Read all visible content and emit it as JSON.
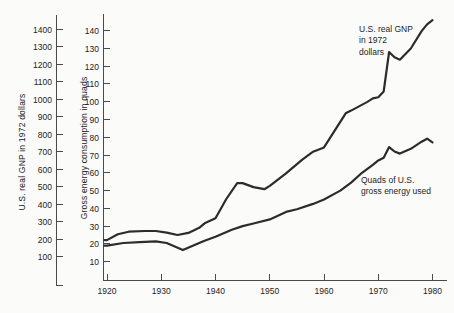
{
  "chart_data": {
    "type": "line",
    "title": "",
    "x_axis": {
      "label": "",
      "ticks": [
        1920,
        1930,
        1940,
        1950,
        1960,
        1970,
        1980
      ],
      "range": [
        1920,
        1980
      ]
    },
    "gnp_axis": {
      "label": "U.S. real GNP in 1972 dollars",
      "ticks": [
        100,
        200,
        300,
        400,
        500,
        600,
        700,
        800,
        900,
        1000,
        1100,
        1200,
        1300,
        1400
      ],
      "range": [
        0,
        1450
      ]
    },
    "energy_axis": {
      "label": "Gross energy consumption in quads",
      "ticks": [
        10,
        20,
        30,
        40,
        50,
        60,
        70,
        80,
        90,
        100,
        110,
        120,
        130,
        140
      ],
      "range": [
        0,
        145
      ]
    },
    "annotations": {
      "gnp": "U.S. real GNP\nin 1972\ndollars",
      "energy": "Quads of U.S.\ngross energy used"
    },
    "series": [
      {
        "name": "U.S. real GNP in 1972 dollars",
        "axis": "gnp",
        "points": [
          [
            1920,
            195
          ],
          [
            1922,
            228
          ],
          [
            1924,
            243
          ],
          [
            1927,
            247
          ],
          [
            1929,
            247
          ],
          [
            1931,
            238
          ],
          [
            1933,
            224
          ],
          [
            1935,
            236
          ],
          [
            1937,
            265
          ],
          [
            1938,
            291
          ],
          [
            1940,
            320
          ],
          [
            1942,
            430
          ],
          [
            1944,
            520
          ],
          [
            1945,
            521
          ],
          [
            1947,
            498
          ],
          [
            1949,
            486
          ],
          [
            1950,
            505
          ],
          [
            1953,
            577
          ],
          [
            1956,
            655
          ],
          [
            1958,
            700
          ],
          [
            1960,
            725
          ],
          [
            1964,
            920
          ],
          [
            1965,
            935
          ],
          [
            1968,
            985
          ],
          [
            1969,
            1005
          ],
          [
            1970,
            1012
          ],
          [
            1971,
            1045
          ],
          [
            1972,
            1270
          ],
          [
            1973,
            1240
          ],
          [
            1974,
            1226
          ],
          [
            1976,
            1290
          ],
          [
            1978,
            1390
          ],
          [
            1979,
            1428
          ],
          [
            1980,
            1452
          ]
        ]
      },
      {
        "name": "Quads of U.S. gross energy used",
        "axis": "energy",
        "points": [
          [
            1920,
            19
          ],
          [
            1923,
            20.5
          ],
          [
            1926,
            21
          ],
          [
            1929,
            21.5
          ],
          [
            1931,
            20.5
          ],
          [
            1934,
            16.5
          ],
          [
            1937,
            20.5
          ],
          [
            1938,
            21.8
          ],
          [
            1940,
            24
          ],
          [
            1943,
            28
          ],
          [
            1945,
            30
          ],
          [
            1947,
            31.5
          ],
          [
            1950,
            33.8
          ],
          [
            1953,
            38
          ],
          [
            1955,
            39.5
          ],
          [
            1958,
            42.5
          ],
          [
            1960,
            45
          ],
          [
            1963,
            50
          ],
          [
            1965,
            54.5
          ],
          [
            1967,
            60
          ],
          [
            1969,
            64.5
          ],
          [
            1970,
            67
          ],
          [
            1971,
            68.5
          ],
          [
            1972,
            74.5
          ],
          [
            1973,
            72
          ],
          [
            1974,
            70.8
          ],
          [
            1976,
            73.5
          ],
          [
            1978,
            77.5
          ],
          [
            1979,
            79.2
          ],
          [
            1980,
            77.2
          ]
        ]
      }
    ],
    "legend_position": "annotations-on-plot",
    "grid": false,
    "colors": {
      "curve": "#2c2c2c",
      "axis": "#4a4a4a",
      "text": "#1d1d1d",
      "background": "#fbfbfa"
    }
  }
}
